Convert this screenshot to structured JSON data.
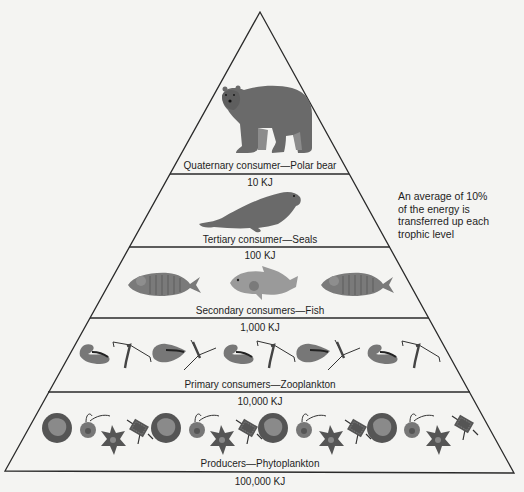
{
  "note": {
    "lines": [
      "An average of 10%",
      "of the energy is",
      "transferred up each",
      "trophic level"
    ]
  },
  "levels": [
    {
      "name": "Quaternary consumer—Polar bear",
      "energy": "10 KJ",
      "organism": "polar-bear"
    },
    {
      "name": "Tertiary consumer—Seals",
      "energy": "100 KJ",
      "organism": "seal"
    },
    {
      "name": "Secondary consumers—Fish",
      "energy": "1,000 KJ",
      "organism": "fish"
    },
    {
      "name": "Primary consumers—Zooplankton",
      "energy": "10,000 KJ",
      "organism": "zooplankton"
    },
    {
      "name": "Producers—Phytoplankton",
      "energy": "100,000 KJ",
      "organism": "phytoplankton"
    }
  ],
  "colors": {
    "line": "#2a2a2a",
    "organism_dark": "#555555",
    "organism_mid": "#7a7a7a",
    "organism_light": "#9a9a9a",
    "background": "#f4f4f2"
  }
}
